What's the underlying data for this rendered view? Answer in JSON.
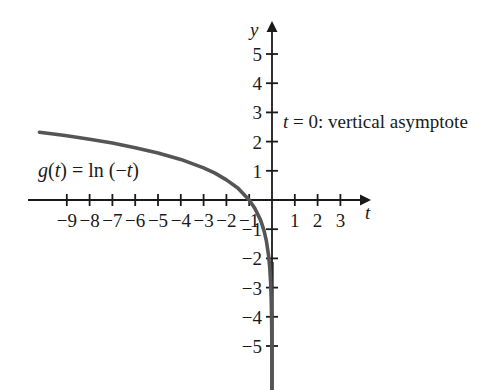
{
  "chart_data": {
    "type": "line",
    "title": "",
    "subtitle": "",
    "xlabel": "t",
    "ylabel": "y",
    "function_label": "g(t) = ln (−t)",
    "annotation": "t = 0: vertical asymptote",
    "grid": false,
    "legend_position": "none",
    "xlim": [
      -10.5,
      4.1
    ],
    "ylim": [
      -6.4,
      5.8
    ],
    "x_ticks": [
      -9,
      -8,
      -7,
      -6,
      -5,
      -4,
      -3,
      -2,
      -1,
      1,
      2,
      3
    ],
    "x_tick_labels": [
      "−9",
      "−8",
      "−7",
      "−6",
      "−5",
      "−4",
      "−3",
      "−2",
      "−1",
      "1",
      "2",
      "3"
    ],
    "y_ticks": [
      5,
      4,
      3,
      2,
      1,
      -1,
      -2,
      -3,
      -4,
      -5
    ],
    "y_tick_labels": [
      "5",
      "4",
      "3",
      "2",
      "1",
      "−1",
      "−2",
      "−3",
      "−4",
      "−5"
    ],
    "asymptote": {
      "axis": "vertical",
      "at": 0,
      "label": "t = 0: vertical asymptote"
    },
    "series": [
      {
        "name": "g(t) = ln (−t)",
        "color": "#555555",
        "x": [
          -10.2,
          -9.5,
          -9.0,
          -8.0,
          -7.0,
          -6.0,
          -5.0,
          -4.0,
          -3.0,
          -2.5,
          -2.0,
          -1.5,
          -1.0,
          -0.75,
          -0.5,
          -0.35,
          -0.25,
          -0.15,
          -0.1,
          -0.06,
          -0.035,
          -0.02,
          -0.012,
          -0.007
        ],
        "y": [
          2.32,
          2.25,
          2.2,
          2.08,
          1.95,
          1.79,
          1.61,
          1.39,
          1.1,
          0.92,
          0.69,
          0.41,
          0.0,
          -0.29,
          -0.69,
          -1.05,
          -1.39,
          -1.9,
          -2.3,
          -2.81,
          -3.35,
          -3.91,
          -4.42,
          -4.96
        ]
      }
    ],
    "x_axis_zero_crossing": -1,
    "curve_start_value": 2.32,
    "curve_end_value": -6.4
  },
  "figure": {
    "y_axis_label": "y",
    "x_axis_label": "t",
    "function_text_parts": {
      "g": "g",
      "open1": "(",
      "t1": "t",
      "close1": ")",
      "equals": " = ln (−",
      "t2": "t",
      "close2": ")"
    },
    "annotation_parts": {
      "t": "t",
      "rest": " = 0: vertical asymptote"
    },
    "colors": {
      "curve": "#555555",
      "axis": "#1a1a1a",
      "asymptote": "#2b2b2b",
      "background": "#ffffff",
      "text": "#1a1a1a"
    }
  }
}
